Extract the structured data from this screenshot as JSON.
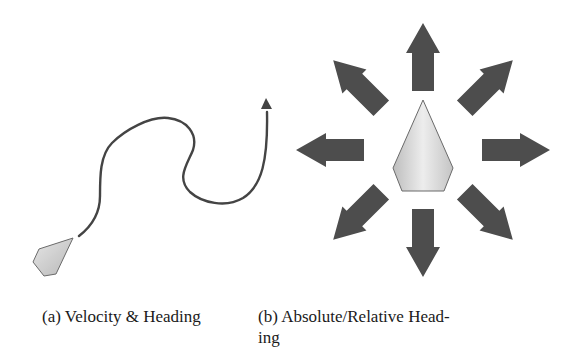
{
  "figure": {
    "subfigures": [
      {
        "id": "a",
        "caption": "(a) Velocity & Heading",
        "elements": [
          "agent-kite",
          "trajectory-curve",
          "trajectory-arrowhead"
        ]
      },
      {
        "id": "b",
        "caption_line1": "(b) Absolute/Relative Head-",
        "caption_line2": "ing",
        "elements": [
          "agent-kite",
          "arrow-up",
          "arrow-up-right",
          "arrow-right",
          "arrow-down-right",
          "arrow-down",
          "arrow-down-left",
          "arrow-left",
          "arrow-up-left"
        ]
      }
    ],
    "colors": {
      "arrow_fill": "#4d4d4d",
      "kite_fill_light": "#ececec",
      "kite_fill_dark": "#bdbdbd",
      "kite_stroke": "#6a6a6a",
      "curve_stroke": "#444444",
      "text": "#1a1a1a"
    }
  }
}
